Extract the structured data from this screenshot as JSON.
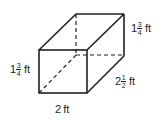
{
  "figure": {
    "type": "rectangular-prism",
    "stroke_color": "#231f20",
    "labels": {
      "height_left": {
        "whole": "1",
        "numerator": "3",
        "denominator": "4",
        "unit": "ft"
      },
      "height_right": {
        "whole": "1",
        "numerator": "3",
        "denominator": "4",
        "unit": "ft"
      },
      "depth": {
        "whole": "2",
        "numerator": "1",
        "denominator": "2",
        "unit": "ft"
      },
      "width": {
        "text": "2",
        "unit": "ft"
      }
    }
  }
}
